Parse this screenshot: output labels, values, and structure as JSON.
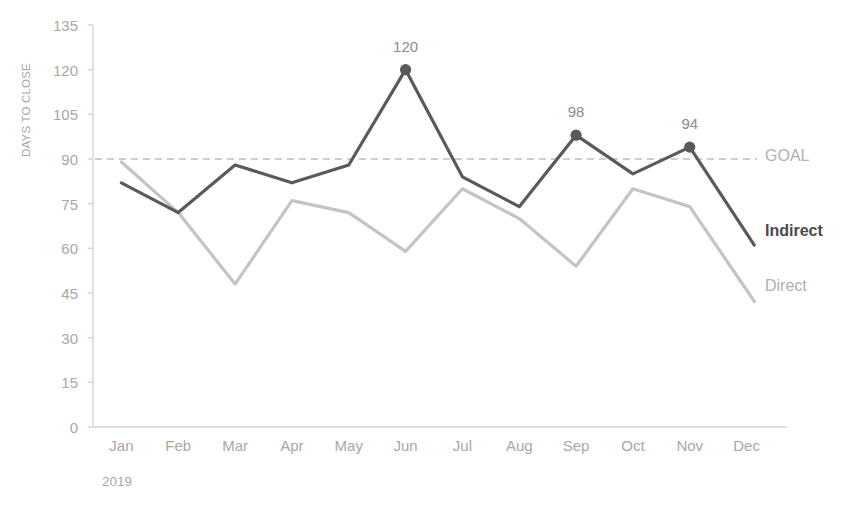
{
  "chart_data": {
    "type": "line",
    "title": "",
    "xlabel": "2019",
    "ylabel": "DAYS TO CLOSE",
    "categories": [
      "Jan",
      "Feb",
      "Mar",
      "Apr",
      "May",
      "Jun",
      "Jul",
      "Aug",
      "Sep",
      "Oct",
      "Nov",
      "Dec"
    ],
    "ylim": [
      0,
      135
    ],
    "yticks": [
      0,
      15,
      30,
      45,
      60,
      75,
      90,
      105,
      120,
      135
    ],
    "ytick_labels": [
      "0",
      "15",
      "30",
      "45",
      "60",
      "75",
      "90",
      "105",
      "120",
      "135"
    ],
    "grid": false,
    "legend_position": "right-inline",
    "series": [
      {
        "name": "Indirect",
        "color": "#5a5a5a",
        "style": "solid",
        "width": 3.2,
        "values": [
          82,
          72,
          88,
          82,
          88,
          120,
          84,
          74,
          98,
          85,
          94,
          65
        ],
        "markers": [
          {
            "category": "Jun",
            "value": 120,
            "label": "120"
          },
          {
            "category": "Sep",
            "value": 98,
            "label": "98"
          },
          {
            "category": "Nov",
            "value": 94,
            "label": "94"
          }
        ]
      },
      {
        "name": "Direct",
        "color": "#c4c4c4",
        "style": "solid",
        "width": 3.2,
        "values": [
          89,
          72,
          48,
          76,
          72,
          59,
          80,
          70,
          54,
          80,
          74,
          46
        ],
        "markers": []
      },
      {
        "name": "GOAL",
        "color": "#bfbfbf",
        "style": "dashed",
        "width": 1.6,
        "constant": 90,
        "values": [
          90,
          90,
          90,
          90,
          90,
          90,
          90,
          90,
          90,
          90,
          90,
          90
        ],
        "markers": []
      }
    ],
    "data_labels": [
      "120",
      "98",
      "94"
    ],
    "axis_color": "#d4d4d4",
    "tick_label_color": "#a8a8a8"
  },
  "labels": {
    "y_axis_title": "DAYS TO CLOSE",
    "year": "2019",
    "goal": "GOAL",
    "indirect": "Indirect",
    "direct": "Direct"
  }
}
